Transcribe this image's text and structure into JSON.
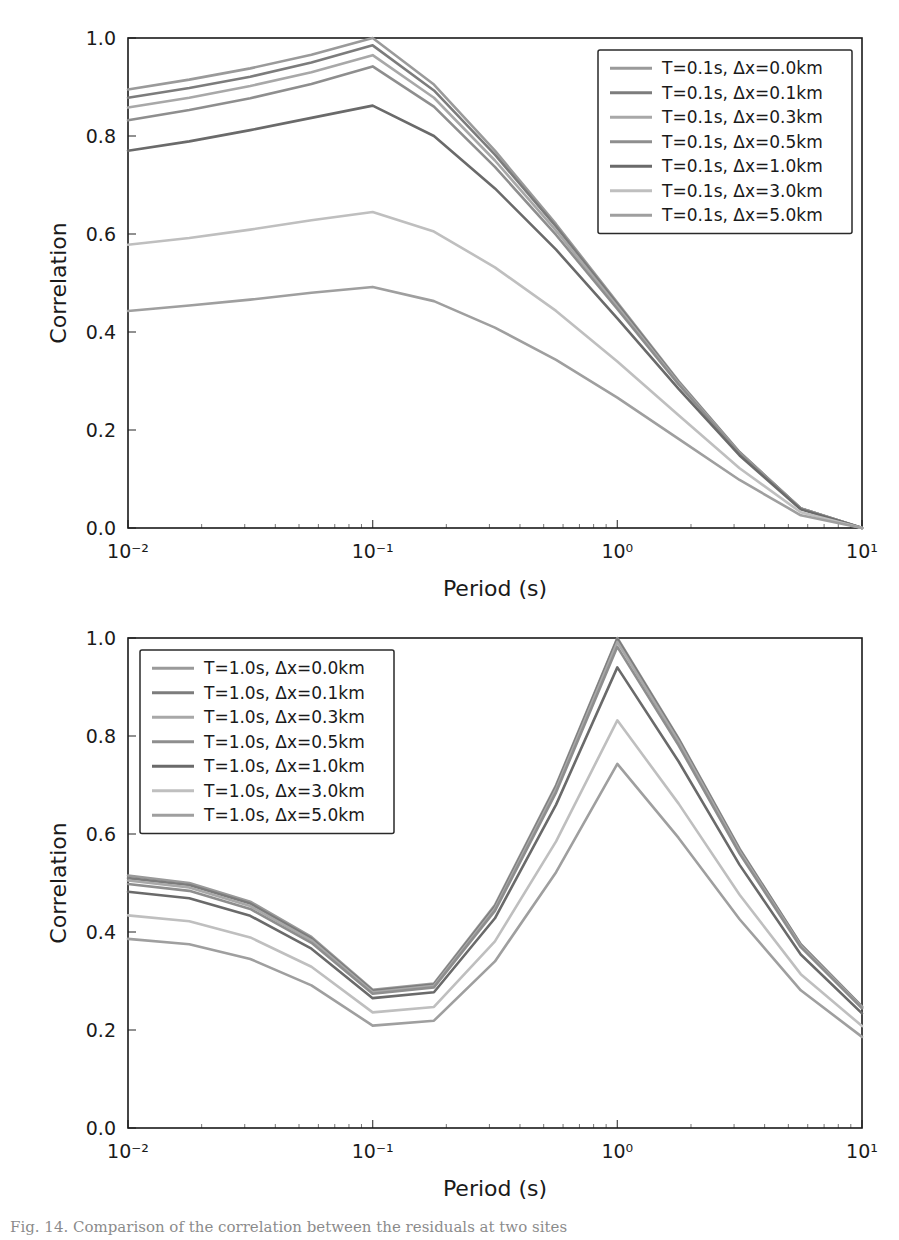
{
  "figure": {
    "width": 899,
    "height": 1240,
    "background": "#ffffff",
    "caption_partial": "Fig. 14. Comparison of the correlation between the residuals at two sites"
  },
  "axis": {
    "xlabel": "Period (s)",
    "ylabel": "Correlation",
    "xticks": [
      "10⁻²",
      "10⁻¹",
      "10⁰",
      "10¹"
    ],
    "xtick_values": [
      0.01,
      0.1,
      1,
      10
    ],
    "yticks": [
      "0.0",
      "0.2",
      "0.4",
      "0.6",
      "0.8",
      "1.0"
    ],
    "ytick_values": [
      0.0,
      0.2,
      0.4,
      0.6,
      0.8,
      1.0
    ],
    "xscale": "log",
    "xlim": [
      0.01,
      10
    ],
    "ylim": [
      0.0,
      1.0
    ],
    "grid": false
  },
  "colors": {
    "curve_0": "#9a9a9a",
    "curve_1": "#7c7c7c",
    "curve_2": "#a8a8a8",
    "curve_3": "#8e8e8e",
    "curve_4": "#6a6a6a",
    "curve_5": "#bfbfbf",
    "curve_6": "#9f9f9f",
    "axis": "#1a1a1a",
    "text": "#1a1a1a",
    "legend_border": "#2a2a2a"
  },
  "chart_data": [
    {
      "type": "line",
      "panel": "top",
      "title": "",
      "xlabel": "Period (s)",
      "ylabel": "Correlation",
      "xscale": "log",
      "xlim": [
        0.01,
        10
      ],
      "ylim": [
        0.0,
        1.0
      ],
      "grid": false,
      "legend_position": "upper right",
      "x": [
        0.01,
        0.0178,
        0.0316,
        0.0562,
        0.1,
        0.178,
        0.316,
        0.562,
        1.0,
        1.78,
        3.16,
        5.62,
        10.0
      ],
      "series": [
        {
          "name": "T=0.1s, Δx=0.0km",
          "color": "#9a9a9a",
          "values": [
            0.895,
            0.915,
            0.938,
            0.966,
            1.0,
            0.905,
            0.77,
            0.62,
            0.46,
            0.3,
            0.155,
            0.04,
            0.0
          ]
        },
        {
          "name": "T=0.1s, Δx=0.1km",
          "color": "#7c7c7c",
          "values": [
            0.878,
            0.898,
            0.921,
            0.95,
            0.985,
            0.893,
            0.762,
            0.615,
            0.457,
            0.298,
            0.154,
            0.04,
            0.0
          ]
        },
        {
          "name": "T=0.1s, Δx=0.3km",
          "color": "#a8a8a8",
          "values": [
            0.858,
            0.878,
            0.902,
            0.93,
            0.965,
            0.878,
            0.75,
            0.607,
            0.452,
            0.296,
            0.153,
            0.04,
            0.0
          ]
        },
        {
          "name": "T=0.1s, Δx=0.5km",
          "color": "#8e8e8e",
          "values": [
            0.832,
            0.853,
            0.877,
            0.906,
            0.942,
            0.86,
            0.737,
            0.598,
            0.447,
            0.293,
            0.152,
            0.04,
            0.0
          ]
        },
        {
          "name": "T=0.1s, Δx=1.0km",
          "color": "#6a6a6a",
          "values": [
            0.77,
            0.789,
            0.812,
            0.837,
            0.862,
            0.8,
            0.693,
            0.568,
            0.428,
            0.284,
            0.148,
            0.038,
            0.0
          ]
        },
        {
          "name": "T=0.1s, Δx=3.0km",
          "color": "#bfbfbf",
          "values": [
            0.578,
            0.592,
            0.609,
            0.628,
            0.645,
            0.605,
            0.532,
            0.443,
            0.34,
            0.23,
            0.122,
            0.032,
            0.0
          ]
        },
        {
          "name": "T=0.1s, Δx=5.0km",
          "color": "#9f9f9f",
          "values": [
            0.443,
            0.454,
            0.466,
            0.48,
            0.492,
            0.463,
            0.409,
            0.343,
            0.266,
            0.182,
            0.098,
            0.026,
            0.0
          ]
        }
      ]
    },
    {
      "type": "line",
      "panel": "bottom",
      "title": "",
      "xlabel": "Period (s)",
      "ylabel": "Correlation",
      "xscale": "log",
      "xlim": [
        0.01,
        10
      ],
      "ylim": [
        0.0,
        1.0
      ],
      "grid": false,
      "legend_position": "upper left",
      "x": [
        0.01,
        0.0178,
        0.0316,
        0.0562,
        0.1,
        0.178,
        0.316,
        0.562,
        1.0,
        1.78,
        3.16,
        5.62,
        10.0
      ],
      "series": [
        {
          "name": "T=1.0s, Δx=0.0km",
          "color": "#9a9a9a",
          "values": [
            0.515,
            0.5,
            0.462,
            0.39,
            0.282,
            0.295,
            0.455,
            0.7,
            1.0,
            0.795,
            0.57,
            0.375,
            0.248
          ]
        },
        {
          "name": "T=1.0s, Δx=0.1km",
          "color": "#7c7c7c",
          "values": [
            0.51,
            0.496,
            0.458,
            0.387,
            0.28,
            0.293,
            0.452,
            0.697,
            0.998,
            0.793,
            0.568,
            0.374,
            0.247
          ]
        },
        {
          "name": "T=1.0s, Δx=0.3km",
          "color": "#a8a8a8",
          "values": [
            0.505,
            0.491,
            0.453,
            0.383,
            0.277,
            0.29,
            0.448,
            0.692,
            0.992,
            0.789,
            0.565,
            0.372,
            0.246
          ]
        },
        {
          "name": "T=1.0s, Δx=0.5km",
          "color": "#8e8e8e",
          "values": [
            0.498,
            0.484,
            0.447,
            0.378,
            0.274,
            0.287,
            0.443,
            0.685,
            0.982,
            0.781,
            0.56,
            0.369,
            0.244
          ]
        },
        {
          "name": "T=1.0s, Δx=1.0km",
          "color": "#6a6a6a",
          "values": [
            0.482,
            0.469,
            0.433,
            0.366,
            0.265,
            0.277,
            0.428,
            0.66,
            0.94,
            0.748,
            0.537,
            0.354,
            0.234
          ]
        },
        {
          "name": "T=1.0s, Δx=3.0km",
          "color": "#bfbfbf",
          "values": [
            0.434,
            0.422,
            0.389,
            0.329,
            0.236,
            0.247,
            0.381,
            0.585,
            0.832,
            0.662,
            0.476,
            0.314,
            0.208
          ]
        },
        {
          "name": "T=1.0s, Δx=5.0km",
          "color": "#9f9f9f",
          "values": [
            0.386,
            0.375,
            0.345,
            0.291,
            0.209,
            0.219,
            0.34,
            0.522,
            0.743,
            0.592,
            0.426,
            0.281,
            0.186
          ]
        }
      ]
    }
  ],
  "legend_top": {
    "entries": [
      "T=0.1s, Δx=0.0km",
      "T=0.1s, Δx=0.1km",
      "T=0.1s, Δx=0.3km",
      "T=0.1s, Δx=0.5km",
      "T=0.1s, Δx=1.0km",
      "T=0.1s, Δx=3.0km",
      "T=0.1s, Δx=5.0km"
    ]
  },
  "legend_bottom": {
    "entries": [
      "T=1.0s, Δx=0.0km",
      "T=1.0s, Δx=0.1km",
      "T=1.0s, Δx=0.3km",
      "T=1.0s, Δx=0.5km",
      "T=1.0s, Δx=1.0km",
      "T=1.0s, Δx=3.0km",
      "T=1.0s, Δx=5.0km"
    ]
  }
}
